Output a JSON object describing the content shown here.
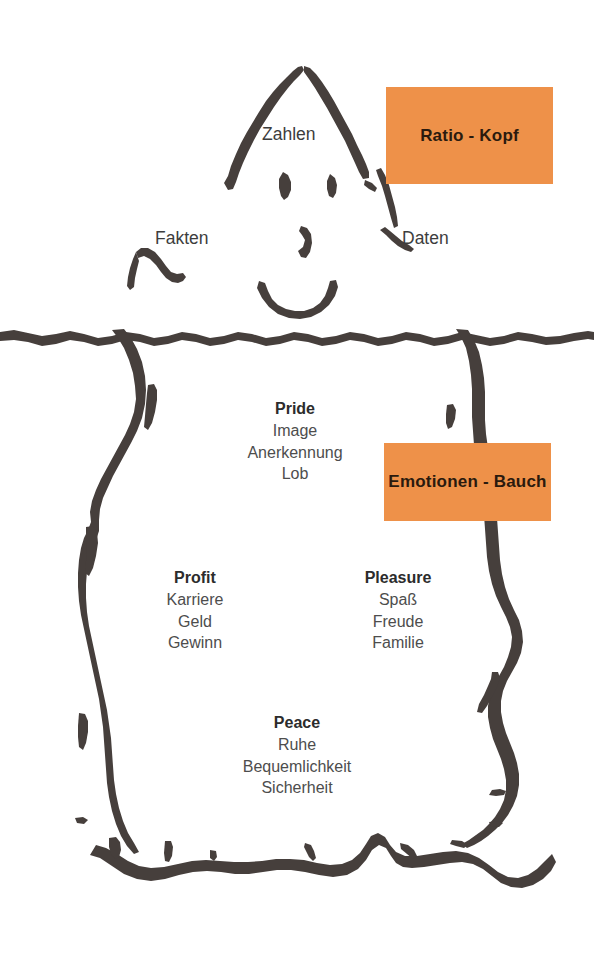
{
  "figure": {
    "kind": "iceberg-diagram",
    "background_color": "#ffffff",
    "ink_color": "#463f3c",
    "accent_color": "#ee9149"
  },
  "callouts": {
    "above_water": "Ratio - Kopf",
    "below_water": "Emotionen - Bauch"
  },
  "above_water_labels": {
    "top": "Zahlen",
    "left": "Fakten",
    "right": "Daten"
  },
  "below_water_blocks": [
    {
      "heading": "Pride",
      "items": [
        "Image",
        "Anerkennung",
        "Lob"
      ]
    },
    {
      "heading": "Profit",
      "items": [
        "Karriere",
        "Geld",
        "Gewinn"
      ]
    },
    {
      "heading": "Pleasure",
      "items": [
        "Spaß",
        "Freude",
        "Familie"
      ]
    },
    {
      "heading": "Peace",
      "items": [
        "Ruhe",
        "Bequemlichkeit",
        "Sicherheit"
      ]
    }
  ]
}
